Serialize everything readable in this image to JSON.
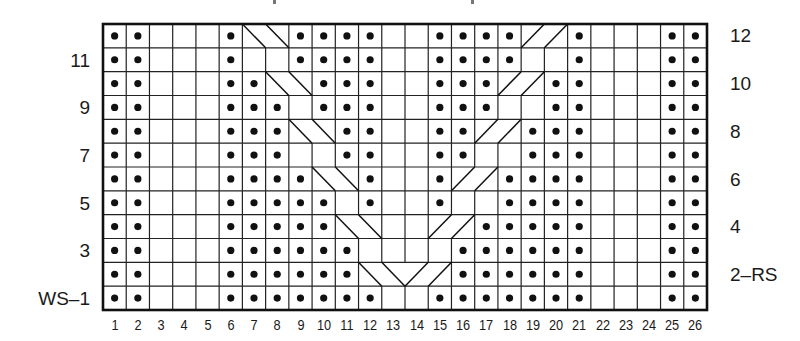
{
  "chart_data": {
    "type": "knitting-chart",
    "title": "",
    "columns": 26,
    "rows": 12,
    "legend": {
      "o": "purl (dot)",
      ".": "knit (blank)",
      "c": "cable crossing cell"
    },
    "grid_rows_top_to_bottom": [
      {
        "row": 12,
        "cells": "oo...occoooo..oooocco...oo"
      },
      {
        "row": 11,
        "cells": "oo...o..oooo..oooo..o...oo"
      },
      {
        "row": 10,
        "cells": "oo...ooccooo..ooocco...oo"
      },
      {
        "row": 9,
        "cells": "oo...ooo.ooo..ooo..oo...oo"
      },
      {
        "row": 8,
        "cells": "oo...oooccoo..oocco oo...oo"
      },
      {
        "row": 7,
        "cells": "oo...ooo..oo..oo..ooo...oo"
      },
      {
        "row": 6,
        "cells": "oo...ooooocco..occoooo...oo"
      },
      {
        "row": 5,
        "cells": "oo...ooooo.o..o..oooo...oo"
      },
      {
        "row": 4,
        "cells": "oo...oooooocc..ccooooo...oo"
      },
      {
        "row": 3,
        "cells": "oo...oooooo....oooooo...oo"
      },
      {
        "row": 2,
        "cells": "oo...ooooooccccoooooo...oo"
      },
      {
        "row": 1,
        "cells": "oo...ooooooo..ooooooo...oo"
      }
    ],
    "rows_matrix": [
      [
        "o",
        "o",
        ".",
        ".",
        ".",
        "o",
        "c",
        "c",
        "o",
        "o",
        "o",
        "o",
        ".",
        ".",
        "o",
        "o",
        "o",
        "o",
        "c",
        "c",
        "o",
        ".",
        ".",
        ".",
        "o",
        "o"
      ],
      [
        "o",
        "o",
        ".",
        ".",
        ".",
        "o",
        ".",
        ".",
        "o",
        "o",
        "o",
        "o",
        ".",
        ".",
        "o",
        "o",
        "o",
        "o",
        ".",
        ".",
        "o",
        ".",
        ".",
        ".",
        "o",
        "o"
      ],
      [
        "o",
        "o",
        ".",
        ".",
        ".",
        "o",
        "o",
        "c",
        "c",
        "o",
        "o",
        "o",
        ".",
        ".",
        "o",
        "o",
        "o",
        "c",
        "c",
        "o",
        "o",
        ".",
        ".",
        ".",
        "o",
        "o"
      ],
      [
        "o",
        "o",
        ".",
        ".",
        ".",
        "o",
        "o",
        "o",
        ".",
        "o",
        "o",
        "o",
        ".",
        ".",
        "o",
        "o",
        "o",
        ".",
        ".",
        "o",
        "o",
        ".",
        ".",
        ".",
        "o",
        "o"
      ],
      [
        "o",
        "o",
        ".",
        ".",
        ".",
        "o",
        "o",
        "o",
        "c",
        "c",
        "o",
        "o",
        ".",
        ".",
        "o",
        "o",
        "c",
        "c",
        "o",
        "o",
        "o",
        ".",
        ".",
        ".",
        "o",
        "o"
      ],
      [
        "o",
        "o",
        ".",
        ".",
        ".",
        "o",
        "o",
        "o",
        ".",
        ".",
        "o",
        "o",
        ".",
        ".",
        "o",
        "o",
        ".",
        ".",
        "o",
        "o",
        "o",
        ".",
        ".",
        ".",
        "o",
        "o"
      ],
      [
        "o",
        "o",
        ".",
        ".",
        ".",
        "o",
        "o",
        "o",
        "o",
        "c",
        "c",
        "o",
        ".",
        ".",
        "o",
        "c",
        "c",
        "o",
        "o",
        "o",
        "o",
        ".",
        ".",
        ".",
        "o",
        "o"
      ],
      [
        "o",
        "o",
        ".",
        ".",
        ".",
        "o",
        "o",
        "o",
        "o",
        "o",
        ".",
        "o",
        ".",
        ".",
        "o",
        ".",
        ".",
        "o",
        "o",
        "o",
        "o",
        ".",
        ".",
        ".",
        "o",
        "o"
      ],
      [
        "o",
        "o",
        ".",
        ".",
        ".",
        "o",
        "o",
        "o",
        "o",
        "o",
        "c",
        "c",
        ".",
        ".",
        "c",
        "c",
        "o",
        "o",
        "o",
        "o",
        "o",
        ".",
        ".",
        ".",
        "o",
        "o"
      ],
      [
        "o",
        "o",
        ".",
        ".",
        ".",
        "o",
        "o",
        "o",
        "o",
        "o",
        "o",
        ".",
        ".",
        ".",
        ".",
        "o",
        "o",
        "o",
        "o",
        "o",
        "o",
        ".",
        ".",
        ".",
        "o",
        "o"
      ],
      [
        "o",
        "o",
        ".",
        ".",
        ".",
        "o",
        "o",
        "o",
        "o",
        "o",
        "o",
        "c",
        "c",
        "c",
        "c",
        "o",
        "o",
        "o",
        "o",
        "o",
        "o",
        ".",
        ".",
        ".",
        "o",
        "o"
      ],
      [
        "o",
        "o",
        ".",
        ".",
        ".",
        "o",
        "o",
        "o",
        "o",
        "o",
        "o",
        "o",
        ".",
        ".",
        "o",
        "o",
        "o",
        "o",
        "o",
        "o",
        "o",
        ".",
        ".",
        ".",
        "o",
        "o"
      ]
    ],
    "cable_lines": [
      [
        6,
        0,
        7,
        1
      ],
      [
        7,
        0,
        8,
        1
      ],
      [
        20,
        0,
        19,
        1
      ],
      [
        19,
        0,
        18,
        1
      ],
      [
        7,
        2,
        8,
        3
      ],
      [
        8,
        2,
        9,
        3
      ],
      [
        19,
        2,
        18,
        3
      ],
      [
        18,
        2,
        17,
        3
      ],
      [
        8,
        4,
        9,
        5
      ],
      [
        9,
        4,
        10,
        5
      ],
      [
        18,
        4,
        17,
        5
      ],
      [
        17,
        4,
        16,
        5
      ],
      [
        9,
        6,
        10,
        7
      ],
      [
        10,
        6,
        11,
        7
      ],
      [
        17,
        6,
        16,
        7
      ],
      [
        16,
        6,
        15,
        7
      ],
      [
        10,
        8,
        11,
        9
      ],
      [
        11,
        8,
        12,
        9
      ],
      [
        16,
        8,
        15,
        9
      ],
      [
        15,
        8,
        14,
        9
      ],
      [
        11,
        10,
        12,
        11
      ],
      [
        12,
        10,
        13,
        11
      ],
      [
        15,
        10,
        14,
        11
      ],
      [
        14,
        10,
        13,
        11
      ]
    ],
    "xlabel_ticks": [
      "1",
      "2",
      "3",
      "4",
      "5",
      "6",
      "7",
      "8",
      "9",
      "10",
      "11",
      "12",
      "13",
      "14",
      "15",
      "16",
      "17",
      "18",
      "19",
      "20",
      "21",
      "22",
      "23",
      "24",
      "25",
      "26"
    ],
    "left_row_labels": [
      {
        "row": 11,
        "label": "11"
      },
      {
        "row": 9,
        "label": "9"
      },
      {
        "row": 7,
        "label": "7"
      },
      {
        "row": 5,
        "label": "5"
      },
      {
        "row": 3,
        "label": "3"
      },
      {
        "row": 1,
        "label": "WS–1"
      }
    ],
    "right_row_labels": [
      {
        "row": 12,
        "label": "12"
      },
      {
        "row": 10,
        "label": "10"
      },
      {
        "row": 8,
        "label": "8"
      },
      {
        "row": 6,
        "label": "6"
      },
      {
        "row": 4,
        "label": "4"
      },
      {
        "row": 2,
        "label": "2–RS"
      }
    ],
    "colors": {
      "ink": "#111111",
      "background": "#ffffff",
      "grid": "#222222"
    }
  },
  "labels": {
    "left": [
      "11",
      "9",
      "7",
      "5",
      "3",
      "WS–1"
    ],
    "right": [
      "12",
      "10",
      "8",
      "6",
      "4",
      "2–RS"
    ],
    "columns": [
      "1",
      "2",
      "3",
      "4",
      "5",
      "6",
      "7",
      "8",
      "9",
      "10",
      "11",
      "12",
      "13",
      "14",
      "15",
      "16",
      "17",
      "18",
      "19",
      "20",
      "21",
      "22",
      "23",
      "24",
      "25",
      "26"
    ]
  }
}
